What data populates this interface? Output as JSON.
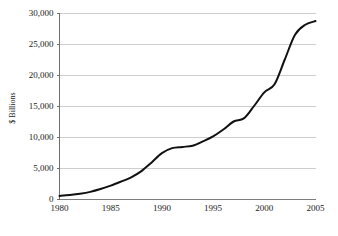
{
  "chart_data": {
    "type": "line",
    "title": "",
    "subtitle": "",
    "xlabel": "",
    "ylabel": "$ Billions",
    "xlim": [
      1980,
      2005
    ],
    "ylim": [
      0,
      30000
    ],
    "grid": true,
    "legend": false,
    "legend_position": "none",
    "x_tick_labels": [
      "1980",
      "1985",
      "1990",
      "1995",
      "2000",
      "2005"
    ],
    "x_ticks": [
      1980,
      1985,
      1990,
      1995,
      2000,
      2005
    ],
    "y_tick_labels": [
      "0",
      "5,000",
      "10,000",
      "15,000",
      "20,000",
      "25,000",
      "30,000"
    ],
    "y_ticks": [
      0,
      5000,
      10000,
      15000,
      20000,
      25000,
      30000
    ],
    "series": [
      {
        "name": "$ Billions",
        "color": "#111111",
        "x": [
          1980,
          1981,
          1982,
          1983,
          1984,
          1985,
          1986,
          1987,
          1988,
          1989,
          1990,
          1991,
          1992,
          1993,
          1994,
          1995,
          1996,
          1997,
          1998,
          1999,
          2000,
          2001,
          2002,
          2003,
          2004,
          2005
        ],
        "values": [
          500,
          650,
          850,
          1150,
          1600,
          2150,
          2800,
          3500,
          4500,
          5900,
          7400,
          8200,
          8400,
          8600,
          9300,
          10100,
          11200,
          12500,
          13000,
          15000,
          17200,
          18500,
          22500,
          26500,
          28100,
          28700
        ]
      }
    ]
  },
  "axis": {
    "y_title": "$ Billions"
  }
}
